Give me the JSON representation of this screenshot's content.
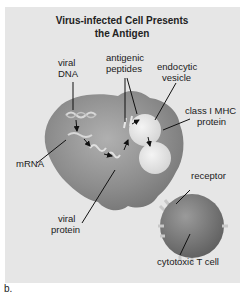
{
  "figure": {
    "title_line1": "Virus-infected Cell Presents",
    "title_line2": "the Antigen",
    "caption": "b.",
    "panel_color": "#e6e6e6",
    "cell_color": "#8a8a8a",
    "tcell_color": "#7a7a7a"
  },
  "labels": {
    "viral_dna_1": "viral",
    "viral_dna_2": "DNA",
    "antigenic_1": "antigenic",
    "antigenic_2": "peptides",
    "endocytic_1": "endocytic",
    "endocytic_2": "vesicle",
    "mhc_1": "class I MHC",
    "mhc_2": "protein",
    "mrna": "mRNA",
    "receptor": "receptor",
    "viral_protein_1": "viral",
    "viral_protein_2": "protein",
    "tcell": "cytotoxic T cell"
  }
}
